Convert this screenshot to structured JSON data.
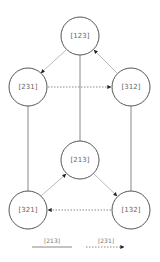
{
  "diagram": {
    "type": "permutation-graph",
    "nodes": [
      {
        "id": "n123",
        "label": "[123]",
        "cx": 80,
        "cy": 36,
        "r": 19
      },
      {
        "id": "n231",
        "label": "[231]",
        "cx": 28,
        "cy": 87,
        "r": 19
      },
      {
        "id": "n312",
        "label": "[312]",
        "cx": 131,
        "cy": 87,
        "r": 19
      },
      {
        "id": "n213",
        "label": "[213]",
        "cx": 80,
        "cy": 160,
        "r": 19
      },
      {
        "id": "n321",
        "label": "[321]",
        "cx": 28,
        "cy": 210,
        "r": 19
      },
      {
        "id": "n132",
        "label": "[132]",
        "cx": 131,
        "cy": 210,
        "r": 19
      }
    ],
    "edges": [
      {
        "from": "[123]",
        "to": "[231]",
        "style": "faint-arrow"
      },
      {
        "from": "[312]",
        "to": "[123]",
        "style": "faint-arrow"
      },
      {
        "from": "[231]",
        "to": "[312]",
        "style": "dashed-arrow"
      },
      {
        "from": "[321]",
        "to": "[213]",
        "style": "faint-arrow"
      },
      {
        "from": "[213]",
        "to": "[132]",
        "style": "faint-arrow"
      },
      {
        "from": "[132]",
        "to": "[321]",
        "style": "dashed-arrow"
      },
      {
        "from": "[123]",
        "to": "[213]",
        "style": "solid"
      },
      {
        "from": "[231]",
        "to": "[321]",
        "style": "solid"
      },
      {
        "from": "[312]",
        "to": "[132]",
        "style": "solid"
      }
    ]
  },
  "legend": {
    "solid_label": "[213]",
    "dashed_label": "[231]"
  },
  "colors": {
    "node_stroke": "#555555",
    "solid_edge": "#888888",
    "faint_edge": "#bbbbbb",
    "arrowhead": "#222222",
    "label": "#666666"
  }
}
